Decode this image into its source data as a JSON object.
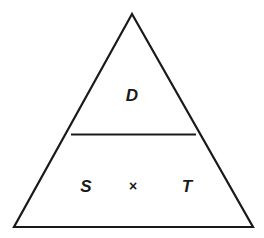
{
  "diagram": {
    "type": "formula-triangle",
    "top": {
      "label": "D"
    },
    "bottom": {
      "left": {
        "label": "S"
      },
      "operator": {
        "label": "×"
      },
      "right": {
        "label": "T"
      }
    },
    "colors": {
      "stroke": "#1a1a1a",
      "background": "#ffffff"
    }
  }
}
